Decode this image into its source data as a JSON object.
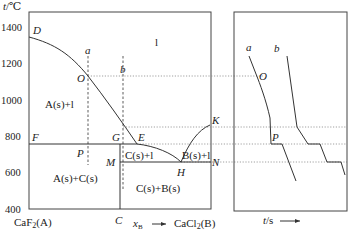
{
  "phase_diagram": {
    "y_axis_label": "t/℃",
    "y_ticks": [
      "1400",
      "1200",
      "1000",
      "800",
      "600",
      "400"
    ],
    "x_left_label": "CaF₂(A)",
    "x_right_label": "CaCl₂(B)",
    "x_axis_label": "x_B",
    "x_axis_sub": "B",
    "point_labels": {
      "D": "D",
      "a": "a",
      "b": "b",
      "O": "O",
      "F": "F",
      "G": "G",
      "E": "E",
      "K": "K",
      "P": "P",
      "M": "M",
      "H": "H",
      "N": "N",
      "C": "C"
    },
    "region_labels": {
      "liquid": "l",
      "A_plus_l": "A(s)+l",
      "A_plus_C": "A(s)+C(s)",
      "C_plus_l": "C(s)+l",
      "B_plus_l": "B(s)+l",
      "C_plus_B": "C(s)+B(s)"
    }
  },
  "cooling_curves": {
    "x_axis_label": "t/s",
    "curve_labels": {
      "a": "a",
      "b": "b"
    },
    "point_labels": {
      "O": "O",
      "P": "P"
    }
  }
}
